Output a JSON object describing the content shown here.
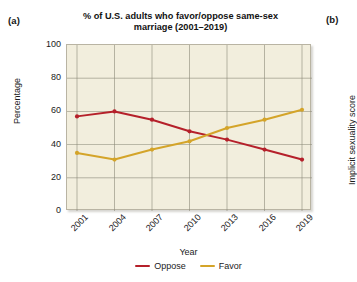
{
  "panels": {
    "a_label": "(a)",
    "b_label": "(b)",
    "b_axis_title": "Implicit sexuality score"
  },
  "chart_data": {
    "type": "line",
    "title": "% of U.S. adults who favor/oppose same-sex marriage (2001–2019)",
    "title_line1": "% of U.S. adults who favor/oppose same-sex",
    "title_line2": "marriage (2001–2019)",
    "xlabel": "Year",
    "ylabel": "Percentage",
    "categories": [
      "2001",
      "2004",
      "2007",
      "2010",
      "2013",
      "2016",
      "2019"
    ],
    "x": [
      2001,
      2004,
      2007,
      2010,
      2013,
      2016,
      2019
    ],
    "ylim": [
      0,
      100
    ],
    "yticks": [
      0,
      20,
      40,
      60,
      80,
      100
    ],
    "grid": true,
    "legend_position": "bottom",
    "series": [
      {
        "name": "Oppose",
        "color": "#B5202A",
        "values": [
          57,
          60,
          55,
          48,
          43,
          37,
          31
        ]
      },
      {
        "name": "Favor",
        "color": "#D4A429",
        "values": [
          35,
          31,
          37,
          42,
          50,
          55,
          61
        ]
      }
    ]
  },
  "colors": {
    "plot_background": "#f2eedd",
    "grid": "#8d8979",
    "frame": "#b9b4a3",
    "oppose": "#B5202A",
    "favor": "#D4A429"
  }
}
